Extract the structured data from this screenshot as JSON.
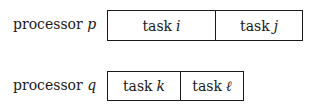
{
  "rows": [
    {
      "label": "processor",
      "var": "p",
      "tasks": [
        {
          "word": "task",
          "var": "i"
        },
        {
          "word": "task",
          "var": "j"
        }
      ]
    },
    {
      "label": "processor",
      "var": "q",
      "tasks": [
        {
          "word": "task",
          "var": "k"
        },
        {
          "word": "task",
          "var": "ℓ"
        }
      ]
    }
  ]
}
